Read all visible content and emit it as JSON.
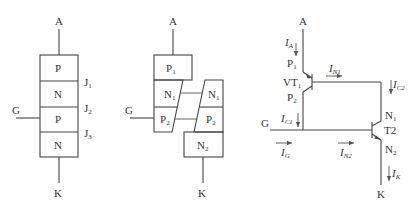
{
  "diagram_1": {
    "title": "Four-layer PNPN structure",
    "terminal_anode": "A",
    "terminal_cathode": "K",
    "terminal_gate": "G",
    "layers": [
      "P",
      "N",
      "P",
      "N"
    ],
    "junctions": [
      {
        "label": "J",
        "sub": "1"
      },
      {
        "label": "J",
        "sub": "2"
      },
      {
        "label": "J",
        "sub": "3"
      }
    ]
  },
  "diagram_2": {
    "title": "Split two-transistor structure",
    "terminal_anode": "A",
    "terminal_cathode": "K",
    "terminal_gate": "G",
    "left_part": [
      {
        "label": "P",
        "sub": "1"
      },
      {
        "label": "N",
        "sub": "1"
      },
      {
        "label": "P",
        "sub": "2"
      }
    ],
    "right_part": [
      {
        "label": "N",
        "sub": "1"
      },
      {
        "label": "P",
        "sub": "2"
      },
      {
        "label": "N",
        "sub": "2"
      }
    ]
  },
  "diagram_3": {
    "title": "Two-transistor equivalent circuit",
    "terminal_anode": "A",
    "terminal_cathode": "K",
    "terminal_gate": "G",
    "transistor_1": {
      "label": "VT",
      "sub": "1"
    },
    "transistor_2": {
      "label": "T2"
    },
    "regions": {
      "p1": {
        "label": "P",
        "sub": "1"
      },
      "p2": {
        "label": "P",
        "sub": "2"
      },
      "n1": {
        "label": "N",
        "sub": "1"
      },
      "n2": {
        "label": "N",
        "sub": "2"
      }
    },
    "currents": {
      "ia": {
        "label": "I",
        "sub": "A"
      },
      "in1": {
        "label": "I",
        "sub": "N1"
      },
      "ic2": {
        "label": "I",
        "sub": "C2"
      },
      "ic1": {
        "label": "I",
        "sub": "C1"
      },
      "ig": {
        "label": "I",
        "sub": "G"
      },
      "in2": {
        "label": "I",
        "sub": "N2"
      },
      "ik": {
        "label": "I",
        "sub": "K"
      }
    }
  }
}
